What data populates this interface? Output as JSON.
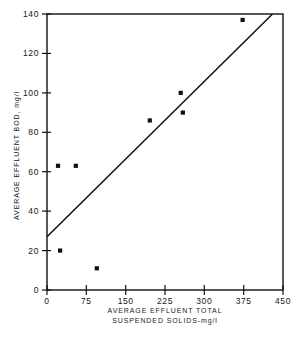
{
  "chart_data": {
    "type": "scatter",
    "title": "",
    "xlabel": "AVERAGE EFFLUENT TOTAL SUSPENDED SOLIDS-mg/l",
    "xlabel_line1": "AVERAGE  EFFLUENT   TOTAL",
    "xlabel_line2": "SUSPENDED  SOLIDS-mg/l",
    "ylabel": "AVERAGE  EFFLUENT  BOD,  mg/l",
    "xlim": [
      0,
      450
    ],
    "ylim": [
      0,
      140
    ],
    "xticks": [
      0,
      75,
      150,
      225,
      300,
      375,
      450
    ],
    "yticks": [
      0,
      20,
      40,
      60,
      80,
      100,
      120,
      140
    ],
    "xtick_labels": [
      "0",
      "75",
      "150",
      "225",
      "300",
      "375",
      "450"
    ],
    "ytick_labels": [
      "0",
      "20",
      "40",
      "60",
      "80",
      "100",
      "120",
      "140"
    ],
    "grid": false,
    "legend": "none",
    "marker": "square",
    "marker_color": "#101010",
    "line_color": "#101010",
    "axis_color": "#101010",
    "points": [
      {
        "x": 21,
        "y": 63
      },
      {
        "x": 55,
        "y": 63
      },
      {
        "x": 25,
        "y": 20
      },
      {
        "x": 95,
        "y": 11
      },
      {
        "x": 196,
        "y": 86
      },
      {
        "x": 255,
        "y": 100
      },
      {
        "x": 259,
        "y": 90
      },
      {
        "x": 373,
        "y": 137
      }
    ],
    "series": [
      {
        "name": "observations",
        "x": [
          21,
          55,
          25,
          95,
          196,
          255,
          259,
          373
        ],
        "values": [
          63,
          63,
          20,
          11,
          86,
          100,
          90,
          137
        ]
      }
    ],
    "trend_line": {
      "name": "regression-line",
      "x0": 0,
      "y0": 27,
      "x1": 430,
      "y1": 140,
      "intercept": 27,
      "slope": 0.2628
    }
  }
}
